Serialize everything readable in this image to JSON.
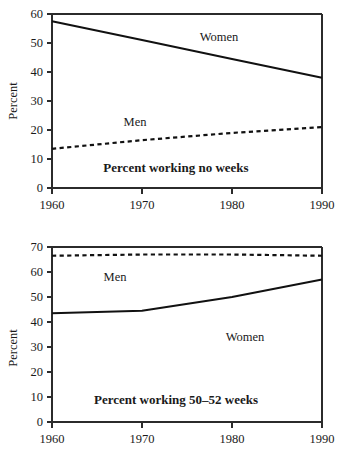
{
  "chart_data": [
    {
      "id": "top",
      "type": "line",
      "title": "Percent working no weeks",
      "xlabel": "",
      "ylabel": "Percent",
      "x": [
        1960,
        1970,
        1980,
        1990
      ],
      "xlim": [
        1960,
        1990
      ],
      "ylim": [
        0,
        60
      ],
      "xticks": [
        "1960",
        "1970",
        "1980",
        "1990"
      ],
      "yticks": [
        "0",
        "10",
        "20",
        "30",
        "40",
        "50",
        "60"
      ],
      "grid": false,
      "legend": "inline-labels",
      "series": [
        {
          "name": "Women",
          "style": "solid",
          "label_x": 1973,
          "label_y": 52,
          "values": [
            57.5,
            51.0,
            44.5,
            38.0
          ]
        },
        {
          "name": "Men",
          "style": "dotted",
          "label_x": 1968,
          "label_y": 24,
          "values": [
            13.5,
            16.5,
            19.0,
            21.0
          ]
        }
      ]
    },
    {
      "id": "bottom",
      "type": "line",
      "title": "Percent working 50–52 weeks",
      "xlabel": "",
      "ylabel": "Percent",
      "x": [
        1960,
        1970,
        1980,
        1990
      ],
      "xlim": [
        1960,
        1990
      ],
      "ylim": [
        0,
        70
      ],
      "xticks": [
        "1960",
        "1970",
        "1980",
        "1990"
      ],
      "yticks": [
        "0",
        "10",
        "20",
        "30",
        "40",
        "50",
        "60",
        "70"
      ],
      "grid": false,
      "legend": "inline-labels",
      "series": [
        {
          "name": "Men",
          "style": "dotted",
          "label_x": 1967,
          "label_y": 61,
          "values": [
            66.5,
            67.0,
            67.0,
            66.5
          ]
        },
        {
          "name": "Women",
          "style": "solid",
          "label_x": 1980,
          "label_y": 44,
          "values": [
            43.5,
            44.5,
            50.0,
            57.0
          ]
        }
      ]
    }
  ],
  "panels": {
    "top": {
      "title": "Percent working no weeks",
      "ylabel": "Percent",
      "yticks": [
        "60",
        "50",
        "40",
        "30",
        "20",
        "10",
        "0"
      ],
      "xticks": [
        "1960",
        "1970",
        "1980",
        "1990"
      ],
      "series_labels": {
        "women": "Women",
        "men": "Men"
      }
    },
    "bottom": {
      "title": "Percent working 50–52 weeks",
      "ylabel": "Percent",
      "yticks": [
        "70",
        "60",
        "50",
        "40",
        "30",
        "20",
        "10",
        "0"
      ],
      "xticks": [
        "1960",
        "1970",
        "1980",
        "1990"
      ],
      "series_labels": {
        "women": "Women",
        "men": "Men"
      }
    }
  }
}
